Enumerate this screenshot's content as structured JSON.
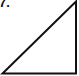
{
  "problem": {
    "number_label": "7."
  },
  "figure": {
    "shape": "right-triangle",
    "stroke_color": "#111111",
    "fill_color": "#ffffff",
    "vertices": {
      "bottom_left": [
        2,
        73
      ],
      "bottom_right": [
        76,
        73
      ],
      "top_right": [
        76,
        1
      ]
    },
    "right_angle_at": "bottom_right"
  }
}
